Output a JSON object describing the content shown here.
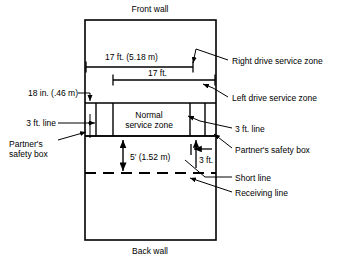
{
  "diagram": {
    "title_top": "Front wall",
    "title_bottom": "Back wall",
    "zones": {
      "normal_service_zone_line1": "Normal",
      "normal_service_zone_line2": "service zone"
    },
    "dimensions": {
      "right_drive_width": "17 ft. (5.18 m)",
      "left_drive_width": "17 ft.",
      "eighteen_inch": "18 in. (.46 m)",
      "five_feet": "5′ (1.52 m)",
      "three_feet": "3 ft."
    },
    "callouts": {
      "right_drive_service_zone": "Right drive service zone",
      "left_drive_service_zone": "Left drive service zone",
      "three_ft_line_left": "3 ft. line",
      "three_ft_line_right": "3 ft. line",
      "partners_safety_box_left_l1": "Partner's",
      "partners_safety_box_left_l2": "safety box",
      "partners_safety_box_right": "Partner's safety box",
      "short_line": "Short line",
      "receiving_line": "Receiving line"
    },
    "colors": {
      "line": "#000000",
      "background": "#ffffff"
    }
  }
}
